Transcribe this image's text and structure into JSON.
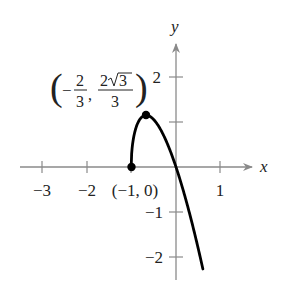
{
  "figure": {
    "type": "function_graph",
    "function": "f(x) = -3x*sqrt(x+1)",
    "axes": {
      "x_label": "x",
      "y_label": "y",
      "x_ticks": [
        {
          "value": -3,
          "label": "−3"
        },
        {
          "value": -2,
          "label": "−2"
        },
        {
          "value": -1,
          "label": ""
        },
        {
          "value": 1,
          "label": "1"
        }
      ],
      "y_ticks": [
        {
          "value": 2,
          "label": "2"
        },
        {
          "value": 1,
          "label": ""
        },
        {
          "value": -1,
          "label": "−1"
        },
        {
          "value": -2,
          "label": "−2"
        }
      ],
      "xlim": [
        -3.3,
        1.7
      ],
      "ylim": [
        -2.5,
        2.6
      ],
      "axis_color": "#8a8a8a",
      "curve_color": "#000000"
    },
    "points": [
      {
        "name": "endpoint",
        "x": -1,
        "y": 0,
        "label": "(−1, 0)"
      },
      {
        "name": "maximum",
        "x": -0.6667,
        "y": 1.1547,
        "label_open": "(",
        "label_x_sign": "−",
        "label_x_num": "2",
        "label_x_den": "3",
        "label_comma": ",",
        "label_y_num_coef": "2",
        "label_y_num_rad": "3",
        "label_y_den": "3",
        "label_close": ")"
      }
    ]
  }
}
